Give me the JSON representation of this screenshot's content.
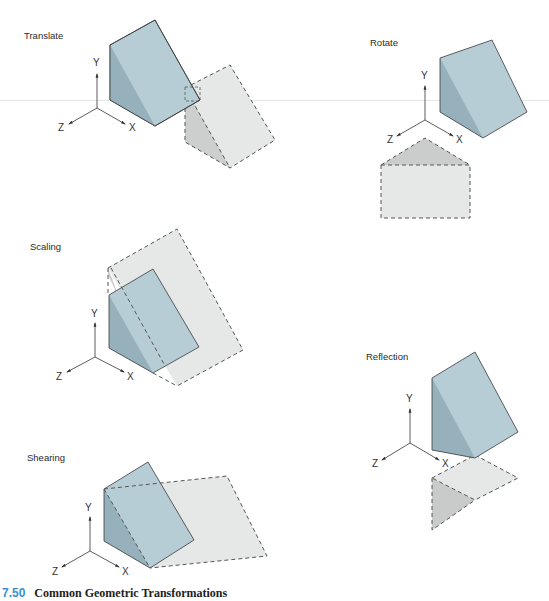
{
  "panels": [
    {
      "id": "translate",
      "label": "Translate"
    },
    {
      "id": "rotate",
      "label": "Rotate"
    },
    {
      "id": "scaling",
      "label": "Scaling"
    },
    {
      "id": "reflection",
      "label": "Reflection"
    },
    {
      "id": "shearing",
      "label": "Shearing"
    }
  ],
  "axes": {
    "x": "X",
    "y": "Y",
    "z": "Z"
  },
  "caption": {
    "number": "7.50",
    "title": "Common Geometric Transformations"
  },
  "colors": {
    "solid_face": "#b7cdd6",
    "solid_side": "#97b1bc",
    "ghost_face": "#e6e8e8",
    "ghost_side": "#cbcdcd",
    "edge": "#3a3a3a",
    "caption_number": "#3a8fd0"
  }
}
